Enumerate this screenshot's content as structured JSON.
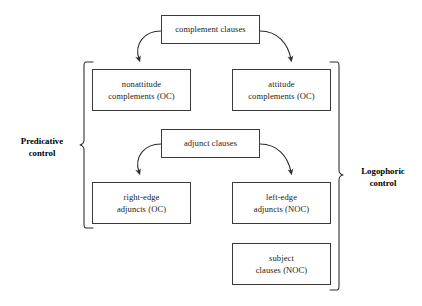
{
  "diagram": {
    "background_color": "#ffffff",
    "line_color": "#3a3a3a",
    "text_color": "#1a1a1a",
    "nodes": {
      "complement_clauses": {
        "line1": "complement clauses",
        "line2": ""
      },
      "nonattitude_complements": {
        "line1": "nonattitude",
        "line2": "complements (OC)"
      },
      "attitude_complements": {
        "line1": "attitude",
        "line2": "complements (OC)"
      },
      "adjunct_clauses": {
        "line1": "adjunct clauses",
        "line2": ""
      },
      "right_edge_adjuncts": {
        "line1": "right-edge",
        "line2": "adjuncts (OC)"
      },
      "left_edge_adjuncts": {
        "line1": "left-edge",
        "line2": "adjuncts (NOC)"
      },
      "subject_clauses": {
        "line1": "subject",
        "line2": "clauses (NOC)"
      }
    },
    "brace_labels": {
      "predicative": {
        "line1": "Predicative",
        "line2": "control"
      },
      "logophoric": {
        "line1": "Logophoric",
        "line2": "control"
      }
    }
  }
}
